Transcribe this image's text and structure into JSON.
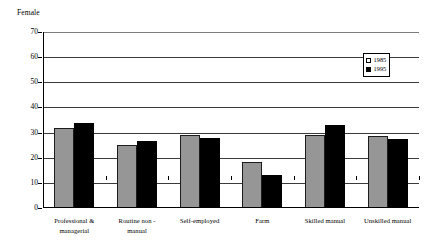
{
  "chart_data": {
    "type": "bar",
    "title": "Female",
    "xlabel": "",
    "ylabel": "",
    "ylim": [
      0,
      70
    ],
    "yticks": [
      0,
      10,
      20,
      30,
      40,
      50,
      60,
      70
    ],
    "grid": true,
    "legend_position": "top-right",
    "categories": [
      "Professional & managerial",
      "Routine non - manual",
      "Self-employed",
      "Farm",
      "Skilled manual",
      "Unskilled manual"
    ],
    "category_lines": [
      [
        "Professional &",
        "managerial"
      ],
      [
        "Routine non  -",
        "manual"
      ],
      [
        "Self-employed",
        ""
      ],
      [
        "Farm",
        ""
      ],
      [
        "Skilled manual",
        ""
      ],
      [
        "Unskilled manual",
        ""
      ]
    ],
    "series": [
      {
        "name": "1985",
        "color": "#969696",
        "values": [
          32,
          25,
          29,
          18.5,
          29,
          28.5
        ]
      },
      {
        "name": "1995",
        "color": "#000000",
        "values": [
          34,
          26.5,
          28,
          13,
          33,
          27.5
        ]
      }
    ]
  },
  "legend": {
    "entries": [
      {
        "label": "1985"
      },
      {
        "label": "1995"
      }
    ]
  },
  "axis": {
    "y_tick_labels": [
      "70",
      "60",
      "50",
      "40",
      "30",
      "20",
      "10",
      "0"
    ]
  }
}
